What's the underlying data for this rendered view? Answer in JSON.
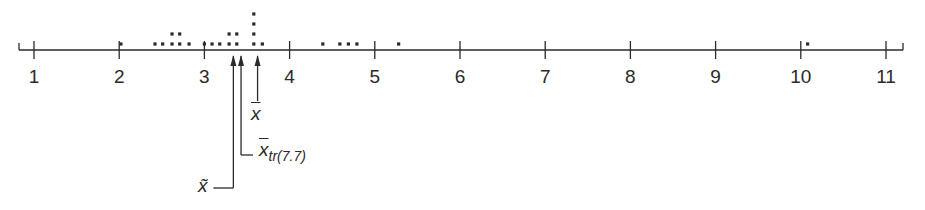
{
  "chart_data": {
    "type": "dotplot",
    "title": "",
    "xlabel": "",
    "ylabel": "",
    "xlim": [
      0.8,
      11.2
    ],
    "x_ticks": [
      1,
      2,
      3,
      4,
      5,
      6,
      7,
      8,
      9,
      10,
      11
    ],
    "tick_labels": [
      "1",
      "2",
      "3",
      "4",
      "5",
      "6",
      "7",
      "8",
      "9",
      "10",
      "11"
    ],
    "grid": false,
    "points": [
      {
        "x": 2.02,
        "count": 1
      },
      {
        "x": 2.42,
        "count": 1
      },
      {
        "x": 2.51,
        "count": 1
      },
      {
        "x": 2.62,
        "count": 2
      },
      {
        "x": 2.71,
        "count": 2
      },
      {
        "x": 2.82,
        "count": 1
      },
      {
        "x": 3.0,
        "count": 1
      },
      {
        "x": 3.09,
        "count": 1
      },
      {
        "x": 3.18,
        "count": 1
      },
      {
        "x": 3.29,
        "count": 2
      },
      {
        "x": 3.38,
        "count": 2
      },
      {
        "x": 3.58,
        "count": 4
      },
      {
        "x": 3.68,
        "count": 1
      },
      {
        "x": 4.39,
        "count": 1
      },
      {
        "x": 4.59,
        "count": 1
      },
      {
        "x": 4.69,
        "count": 1
      },
      {
        "x": 4.79,
        "count": 1
      },
      {
        "x": 5.28,
        "count": 1
      },
      {
        "x": 10.08,
        "count": 1
      }
    ],
    "annotations": [
      {
        "name": "median",
        "symbol": "x̃",
        "x": 3.34
      },
      {
        "name": "trimmed_mean",
        "symbol": "x̄",
        "subscript": "tr(7.7)",
        "x": 3.43
      },
      {
        "name": "mean",
        "symbol": "x̄",
        "x": 3.63
      }
    ]
  },
  "labels": {
    "mean": "x",
    "trimmed_mean": "x",
    "trimmed_sub": "tr(7.7)",
    "median": "x̃"
  },
  "colors": {
    "ink": "#2a2a2a"
  }
}
